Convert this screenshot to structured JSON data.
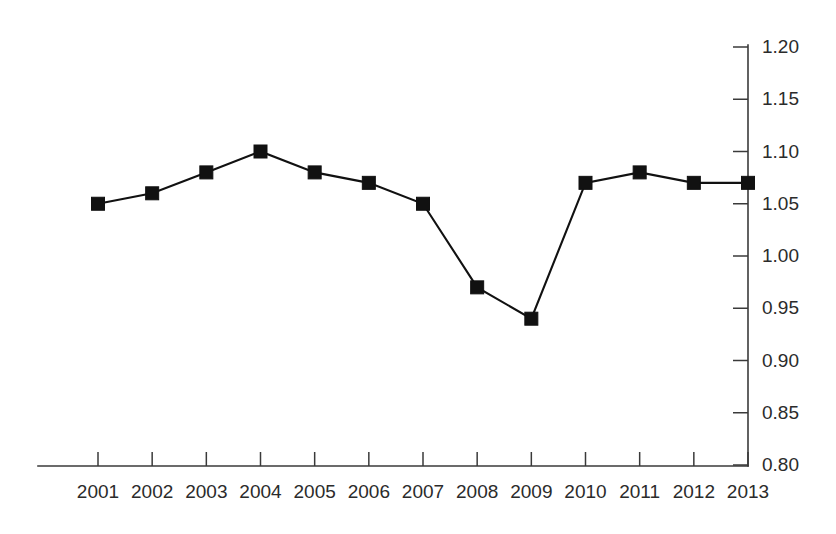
{
  "chart_data": {
    "type": "line",
    "title": "",
    "subtitle": "",
    "xlabel": "",
    "ylabel": "",
    "categories": [
      "2001",
      "2002",
      "2003",
      "2004",
      "2005",
      "2006",
      "2007",
      "2008",
      "2009",
      "2010",
      "2011",
      "2012",
      "2013"
    ],
    "values": [
      1.05,
      1.06,
      1.08,
      1.1,
      1.08,
      1.07,
      1.05,
      0.97,
      0.94,
      1.07,
      1.08,
      1.07,
      1.07
    ],
    "series": [
      {
        "name": "",
        "values": [
          1.05,
          1.06,
          1.08,
          1.1,
          1.08,
          1.07,
          1.05,
          0.97,
          0.94,
          1.07,
          1.08,
          1.07,
          1.07
        ]
      }
    ],
    "ylim": [
      0.8,
      1.2
    ],
    "ytick_values": [
      0.8,
      0.85,
      0.9,
      0.95,
      1.0,
      1.05,
      1.1,
      1.15,
      1.2
    ],
    "ytick_labels": [
      "0.80",
      "0.85",
      "0.90",
      "0.95",
      "1.00",
      "1.05",
      "1.10",
      "1.15",
      "1.20"
    ],
    "xtick_labels": [
      "2001",
      "2002",
      "2003",
      "2004",
      "2005",
      "2006",
      "2007",
      "2008",
      "2009",
      "2010",
      "2011",
      "2012",
      "2013"
    ],
    "grid": false,
    "legend": false,
    "legend_position": "none",
    "y_axis_side": "right",
    "marker": "square",
    "line_color": "#111111",
    "marker_color": "#111111",
    "axis_color": "#3a3a3a",
    "background_color": "#ffffff"
  }
}
